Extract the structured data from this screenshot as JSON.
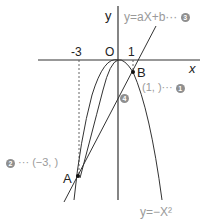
{
  "diagram": {
    "axes": {
      "x_label": "x",
      "y_label": "y",
      "origin_label": "O",
      "tick_labels": [
        "-3",
        "1"
      ]
    },
    "curves": [
      {
        "name": "parabola",
        "equation": "y=-x²"
      },
      {
        "name": "line",
        "equation": "y=ax+b"
      }
    ],
    "labels": {
      "line_eq": "y=aX+b···",
      "line_eq_marker": "3",
      "parabola_eq": "y=−X²",
      "point_a": "A",
      "point_b": "B",
      "coord_b": "(1,    )···",
      "coord_b_marker": "1",
      "coord_a_prefix": "···",
      "coord_a": "(−3,    )",
      "coord_a_marker": "2",
      "intercept_marker": "4"
    },
    "points": [
      {
        "name": "A",
        "x": -3
      },
      {
        "name": "B",
        "x": 1
      }
    ],
    "colors": {
      "lines": "#333333",
      "labels": "#9a9a9a",
      "marker": "#8f8f8f"
    }
  }
}
